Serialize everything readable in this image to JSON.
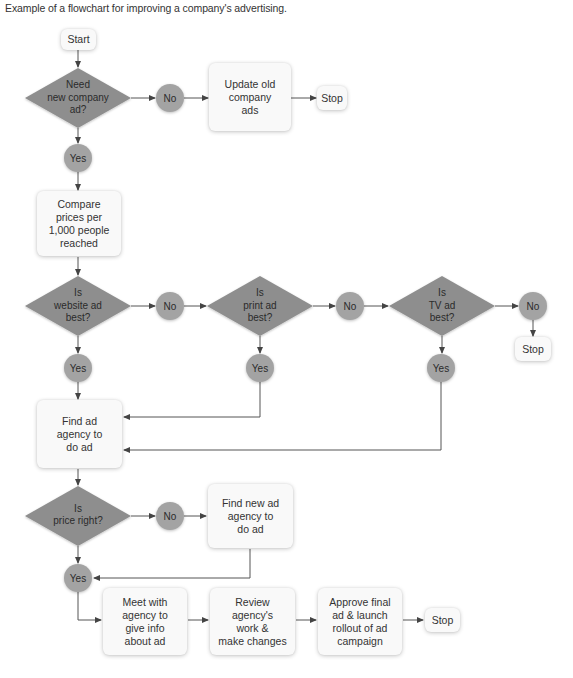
{
  "caption": "Example of a flowchart for improving a company's advertising.",
  "colors": {
    "diamond_fill": "#8e8e8e",
    "circle_fill": "#a3a3a3",
    "box_fill": "#f9f9f9",
    "line": "#555555"
  },
  "nodes": {
    "start": "Start",
    "q_need_ad": "Need\nnew company\nad?",
    "no_1": "No",
    "update_old": "Update old\ncompany\nads",
    "stop_1": "Stop",
    "yes_1": "Yes",
    "compare_prices": "Compare\nprices per\n1,000 people\nreached",
    "q_website": "Is\nwebsite ad\nbest?",
    "no_2": "No",
    "q_print": "Is\nprint ad\nbest?",
    "no_3": "No",
    "q_tv": "Is\nTV ad\nbest?",
    "no_4": "No",
    "stop_2": "Stop",
    "yes_website": "Yes",
    "yes_print": "Yes",
    "yes_tv": "Yes",
    "find_agency": "Find ad\nagency to\ndo ad",
    "q_price": "Is\nprice right?",
    "no_5": "No",
    "find_new_agency": "Find new ad\nagency to\ndo ad",
    "yes_price": "Yes",
    "meet_agency": "Meet with\nagency to\ngive info\nabout ad",
    "review_work": "Review\nagency's\nwork &\nmake changes",
    "approve_final": "Approve final\nad & launch\nrollout of ad\ncampaign",
    "stop_3": "Stop"
  }
}
